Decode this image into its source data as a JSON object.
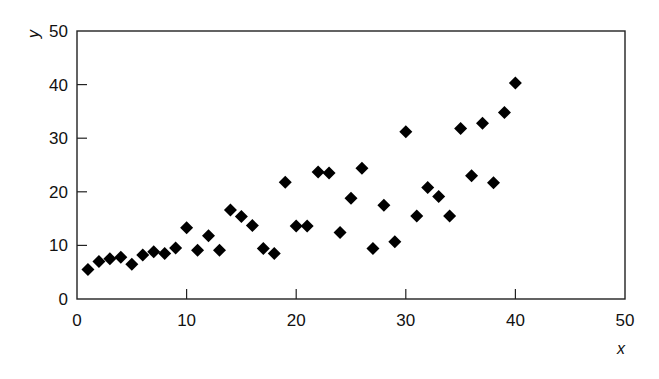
{
  "chart_data": {
    "type": "scatter",
    "title": "",
    "xlabel": "x",
    "ylabel": "y",
    "xlim": [
      0,
      50
    ],
    "ylim": [
      0,
      50
    ],
    "x_ticks": [
      0,
      10,
      20,
      30,
      40,
      50
    ],
    "y_ticks": [
      0,
      10,
      20,
      30,
      40,
      50
    ],
    "x_tick_labels": [
      "0",
      "10",
      "20",
      "30",
      "40",
      "50"
    ],
    "y_tick_labels": [
      "0",
      "10",
      "20",
      "30",
      "40",
      "50"
    ],
    "grid": false,
    "legend": null,
    "marker": "diamond",
    "marker_color": "#000000",
    "series": [
      {
        "name": "data",
        "points": [
          {
            "x": 1,
            "y": 5.5
          },
          {
            "x": 2,
            "y": 7.0
          },
          {
            "x": 3,
            "y": 7.5
          },
          {
            "x": 4,
            "y": 7.8
          },
          {
            "x": 5,
            "y": 6.5
          },
          {
            "x": 6,
            "y": 8.2
          },
          {
            "x": 7,
            "y": 8.8
          },
          {
            "x": 8,
            "y": 8.5
          },
          {
            "x": 9,
            "y": 9.5
          },
          {
            "x": 10,
            "y": 13.3
          },
          {
            "x": 11,
            "y": 9.1
          },
          {
            "x": 12,
            "y": 11.8
          },
          {
            "x": 13,
            "y": 9.1
          },
          {
            "x": 14,
            "y": 16.6
          },
          {
            "x": 15,
            "y": 15.4
          },
          {
            "x": 16,
            "y": 13.7
          },
          {
            "x": 17,
            "y": 9.4
          },
          {
            "x": 18,
            "y": 8.5
          },
          {
            "x": 19,
            "y": 21.8
          },
          {
            "x": 20,
            "y": 13.6
          },
          {
            "x": 21,
            "y": 13.6
          },
          {
            "x": 22,
            "y": 23.7
          },
          {
            "x": 23,
            "y": 23.5
          },
          {
            "x": 24,
            "y": 12.4
          },
          {
            "x": 25,
            "y": 18.8
          },
          {
            "x": 26,
            "y": 24.4
          },
          {
            "x": 27,
            "y": 9.4
          },
          {
            "x": 28,
            "y": 17.5
          },
          {
            "x": 29,
            "y": 10.7
          },
          {
            "x": 30,
            "y": 31.2
          },
          {
            "x": 31,
            "y": 15.5
          },
          {
            "x": 32,
            "y": 20.8
          },
          {
            "x": 33,
            "y": 19.1
          },
          {
            "x": 34,
            "y": 15.5
          },
          {
            "x": 35,
            "y": 31.8
          },
          {
            "x": 36,
            "y": 23.0
          },
          {
            "x": 37,
            "y": 32.8
          },
          {
            "x": 38,
            "y": 21.7
          },
          {
            "x": 39,
            "y": 34.8
          },
          {
            "x": 40,
            "y": 40.3
          }
        ]
      }
    ]
  },
  "layout": {
    "plot_left": 77,
    "plot_top": 31,
    "plot_right": 625,
    "plot_bottom": 299,
    "marker_half_size": 6.5
  }
}
